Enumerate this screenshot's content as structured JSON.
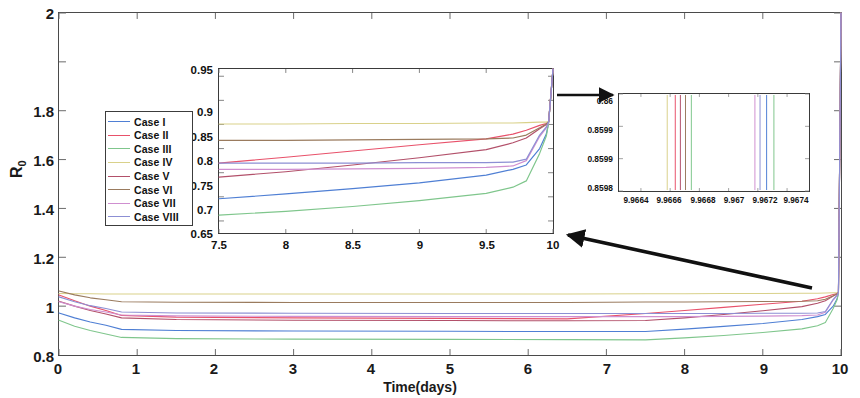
{
  "figure": {
    "background": "#ffffff",
    "axis_color": "#4a4a4a"
  },
  "main_axes": {
    "xlabel": "Time(days)",
    "ylabel_main": "R",
    "ylabel_sub": "0",
    "xticks": [
      "0",
      "1",
      "2",
      "3",
      "4",
      "5",
      "6",
      "7",
      "8",
      "9",
      "10"
    ],
    "yticks": [
      "0.8",
      "1",
      "1.2",
      "1.4",
      "1.6",
      "1.8",
      "2"
    ],
    "xlim": [
      0,
      10
    ],
    "ylim": [
      0.6,
      2.0
    ]
  },
  "legend": {
    "items": [
      {
        "label": "Case I",
        "color": "#4f7fd4"
      },
      {
        "label": "Case II",
        "color": "#e8516a"
      },
      {
        "label": "Case III",
        "color": "#7fc68c"
      },
      {
        "label": "Case IV",
        "color": "#d9d18a"
      },
      {
        "label": "Case V",
        "color": "#b2506a"
      },
      {
        "label": "Case VI",
        "color": "#9a7b5e"
      },
      {
        "label": "Case VII",
        "color": "#cf8fd0"
      },
      {
        "label": "Case VIII",
        "color": "#8c8fd4"
      }
    ]
  },
  "inset1": {
    "xticks": [
      "7.5",
      "8",
      "8.5",
      "9",
      "9.5",
      "10"
    ],
    "yticks": [
      "0.65",
      "0.7",
      "0.75",
      "0.8",
      "0.85",
      "0.9",
      "0.95"
    ],
    "xlim": [
      7.5,
      10
    ],
    "ylim": [
      0.625,
      0.965
    ]
  },
  "inset2": {
    "xticks": [
      "9.9664",
      "9.9666",
      "9.9668",
      "9.967",
      "9.9672",
      "9.9674"
    ],
    "yticks": [
      "0.86",
      "0.8599",
      "0.8599",
      "0.8598"
    ],
    "xlim": [
      9.96625,
      9.96755
    ],
    "ylim": [
      0.85975,
      0.86005
    ]
  },
  "chart_data": {
    "type": "line",
    "title": "",
    "xlabel": "Time(days)",
    "ylabel": "R_0",
    "xlim": [
      0,
      10
    ],
    "ylim": [
      0.6,
      2.0
    ],
    "grid": false,
    "legend_position": "upper-left",
    "x": [
      0,
      0.2,
      0.4,
      0.6,
      0.8,
      1.5,
      3,
      5,
      6.5,
      7.5,
      8,
      8.5,
      9,
      9.5,
      9.7,
      9.8,
      9.9,
      9.95,
      9.966,
      9.9675,
      10
    ],
    "series": [
      {
        "name": "Case I",
        "color": "#4f7fd4",
        "values": [
          0.772,
          0.752,
          0.735,
          0.722,
          0.705,
          0.7,
          0.698,
          0.697,
          0.696,
          0.696,
          0.706,
          0.717,
          0.729,
          0.745,
          0.757,
          0.766,
          0.8,
          0.83,
          0.852,
          0.855,
          2.0
        ]
      },
      {
        "name": "Case II",
        "color": "#e8516a",
        "values": [
          0.846,
          0.822,
          0.8,
          0.782,
          0.762,
          0.755,
          0.752,
          0.75,
          0.748,
          0.77,
          0.782,
          0.795,
          0.808,
          0.82,
          0.83,
          0.838,
          0.848,
          0.852,
          0.855,
          0.856,
          2.0
        ]
      },
      {
        "name": "Case III",
        "color": "#7fc68c",
        "values": [
          0.742,
          0.718,
          0.7,
          0.686,
          0.672,
          0.667,
          0.665,
          0.664,
          0.663,
          0.662,
          0.67,
          0.68,
          0.692,
          0.707,
          0.72,
          0.733,
          0.79,
          0.826,
          0.851,
          0.854,
          2.0
        ]
      },
      {
        "name": "Case IV",
        "color": "#d9d18a",
        "values": [
          0.852,
          0.851,
          0.851,
          0.85,
          0.85,
          0.85,
          0.85,
          0.85,
          0.85,
          0.851,
          0.851,
          0.852,
          0.852,
          0.853,
          0.853,
          0.854,
          0.855,
          0.855,
          0.856,
          0.856,
          2.0
        ]
      },
      {
        "name": "Case V",
        "color": "#b2506a",
        "values": [
          0.82,
          0.8,
          0.782,
          0.768,
          0.752,
          0.745,
          0.742,
          0.741,
          0.74,
          0.741,
          0.752,
          0.766,
          0.781,
          0.798,
          0.812,
          0.822,
          0.841,
          0.85,
          0.855,
          0.856,
          2.0
        ]
      },
      {
        "name": "Case VI",
        "color": "#9a7b5e",
        "values": [
          0.862,
          0.846,
          0.834,
          0.826,
          0.818,
          0.816,
          0.815,
          0.815,
          0.815,
          0.817,
          0.817,
          0.818,
          0.819,
          0.82,
          0.822,
          0.828,
          0.843,
          0.851,
          0.855,
          0.856,
          2.0
        ]
      },
      {
        "name": "Case VII",
        "color": "#cf8fd0",
        "values": [
          0.818,
          0.8,
          0.786,
          0.776,
          0.764,
          0.76,
          0.758,
          0.757,
          0.757,
          0.757,
          0.757,
          0.758,
          0.759,
          0.761,
          0.764,
          0.775,
          0.825,
          0.843,
          0.854,
          0.855,
          2.0
        ]
      },
      {
        "name": "Case VIII",
        "color": "#8c8fd4",
        "values": [
          0.838,
          0.818,
          0.802,
          0.79,
          0.776,
          0.772,
          0.771,
          0.77,
          0.77,
          0.77,
          0.77,
          0.77,
          0.771,
          0.771,
          0.772,
          0.778,
          0.828,
          0.845,
          0.855,
          0.856,
          2.0
        ]
      }
    ],
    "inset1": {
      "type": "line",
      "xlim": [
        7.5,
        10
      ],
      "ylim": [
        0.625,
        0.965
      ],
      "xticks": [
        7.5,
        8,
        8.5,
        9,
        9.5,
        10
      ],
      "yticks": [
        0.65,
        0.7,
        0.75,
        0.8,
        0.85,
        0.9,
        0.95
      ],
      "note": "magnified view of the 7.5-10 day window of the main axes"
    },
    "inset2": {
      "type": "line",
      "xlim": [
        9.96625,
        9.96755
      ],
      "ylim": [
        0.85975,
        0.86005
      ],
      "xticks": [
        9.9664,
        9.9666,
        9.9668,
        9.967,
        9.9672,
        9.9674
      ],
      "yticks": [
        0.8598,
        0.8599,
        0.8599,
        0.86
      ],
      "note": "extreme magnification: near-vertical crossings of the eight curves",
      "vertical_lines_x": [
        9.96658,
        9.966635,
        9.96667,
        9.966705,
        9.966745,
        9.96718,
        9.967215,
        9.96726,
        9.96731
      ]
    }
  },
  "annotations": {
    "arrow1": "short horizontal arrow from inset 1 right edge to inset 2",
    "arrow2": "long diagonal arrow from main curve cluster up-left to inset 1 bottom-right corner"
  }
}
